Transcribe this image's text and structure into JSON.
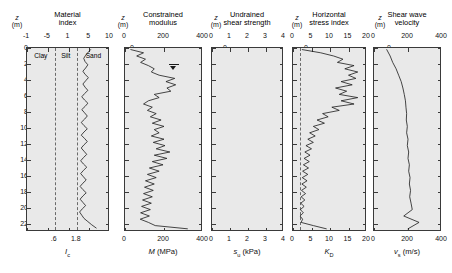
{
  "figure": {
    "depth_axis": {
      "label_symbol": "z",
      "label_unit": "(m)",
      "ticks": [
        0,
        2,
        4,
        6,
        8,
        10,
        12,
        14,
        16,
        18,
        20,
        22
      ],
      "min": 0,
      "max": 23,
      "direction": "down"
    },
    "background_color": "#e9e9e9",
    "curve_color": "#1a1a1a",
    "frame_color": "#3a3a3a"
  },
  "panels": [
    {
      "id": "material-index",
      "title_line1": "Material",
      "title_line2": "index",
      "top_ticks": [
        "-1",
        "-5",
        "1",
        "5",
        "10"
      ],
      "bottom_ticks": [
        ".6",
        "1.8"
      ],
      "axis_title_symbol": "I",
      "axis_title_sub": "c",
      "axis_title_unit": "",
      "zones": [
        "Clay",
        "Silt",
        "Sand"
      ],
      "xmin": 0,
      "xmax": 3,
      "dividers": [
        1.0,
        1.8
      ]
    },
    {
      "id": "constrained-modulus",
      "title_line1": "Constrained",
      "title_line2": "modulus",
      "ticks": [
        0,
        200,
        400
      ],
      "axis_title_symbol": "M",
      "axis_title_unit": "(MPa)",
      "xmin": 0,
      "xmax": 400,
      "water_table_depth": 2.0
    },
    {
      "id": "undrained-shear-strength",
      "title_line1": "Undrained",
      "title_line2": "shear strength",
      "ticks": [
        0,
        1,
        2,
        3,
        4
      ],
      "axis_title_symbol": "s",
      "axis_title_sub": "u",
      "axis_title_unit": "(kPa)",
      "xmin": 0,
      "xmax": 4
    },
    {
      "id": "horizontal-stress-index",
      "title_line1": "Horizontal",
      "title_line2": "stress index",
      "ticks": [
        0,
        5,
        10,
        15,
        20
      ],
      "axis_title_symbol": "K",
      "axis_title_sub": "D",
      "axis_title_unit": "",
      "xmin": 0,
      "xmax": 20,
      "reference_line": 2
    },
    {
      "id": "shear-wave-velocity",
      "title_line1": "Shear wave",
      "title_line2": "velocity",
      "ticks": [
        0,
        200,
        400
      ],
      "axis_title_symbol": "v",
      "axis_title_sub": "s",
      "axis_title_unit": "(m/s)",
      "xmin": 0,
      "xmax": 400
    }
  ],
  "chart_data": {
    "type": "line",
    "ylabel": "z (m)",
    "ylim": [
      0,
      23
    ],
    "grid": false,
    "legend": "none",
    "orientation": "depth-on-y-inverted",
    "series": [
      {
        "name": "Material index",
        "panel": "material-index",
        "xlabel": "I_c",
        "xlim": [
          0,
          3
        ],
        "top_axis_ticks": [
          -1,
          -5,
          1,
          5,
          10
        ],
        "bottom_axis_ticks": [
          0.6,
          1.8
        ],
        "zone_boundaries": [
          1.0,
          1.8
        ],
        "depth": [
          0.2,
          0.5,
          0.9,
          1.3,
          1.7,
          2.1,
          2.5,
          2.9,
          3.3,
          3.7,
          4.1,
          4.5,
          4.9,
          5.3,
          5.7,
          6.1,
          6.5,
          6.9,
          7.3,
          7.7,
          8.1,
          8.5,
          8.9,
          9.3,
          9.7,
          10.1,
          10.5,
          10.9,
          11.3,
          11.7,
          12.1,
          12.5,
          12.9,
          13.3,
          13.7,
          14.1,
          14.5,
          14.9,
          15.3,
          15.7,
          16.1,
          16.5,
          16.9,
          17.3,
          17.7,
          18.1,
          18.5,
          18.9,
          19.3,
          19.7,
          20.1,
          20.5,
          20.9,
          21.3,
          21.7,
          22.1,
          22.5
        ],
        "values": [
          2.3,
          2.22,
          2.12,
          2.05,
          2.1,
          2.2,
          2.12,
          2.02,
          2.1,
          2.22,
          2.12,
          2.02,
          2.1,
          2.2,
          2.08,
          1.98,
          2.08,
          2.2,
          2.1,
          1.98,
          2.08,
          2.18,
          2.08,
          1.96,
          2.06,
          2.18,
          2.06,
          1.96,
          2.08,
          2.18,
          2.06,
          1.96,
          2.06,
          2.16,
          2.04,
          1.94,
          2.04,
          2.16,
          2.04,
          1.94,
          2.04,
          2.14,
          2.02,
          1.92,
          2.02,
          2.14,
          2.02,
          1.92,
          2.02,
          2.12,
          2.0,
          1.9,
          1.98,
          2.06,
          2.2,
          2.34,
          2.5
        ]
      },
      {
        "name": "Constrained modulus",
        "panel": "constrained-modulus",
        "xlabel": "M (MPa)",
        "xlim": [
          0,
          400
        ],
        "depth": [
          0.2,
          0.6,
          1.0,
          1.4,
          1.8,
          2.2,
          2.6,
          3.0,
          3.4,
          3.8,
          4.2,
          4.6,
          5.0,
          5.4,
          5.8,
          6.2,
          6.6,
          7.0,
          7.4,
          7.8,
          8.2,
          8.6,
          9.0,
          9.4,
          9.8,
          10.2,
          10.6,
          11.0,
          11.4,
          11.8,
          12.2,
          12.6,
          13.0,
          13.4,
          13.8,
          14.2,
          14.6,
          15.0,
          15.4,
          15.8,
          16.2,
          16.6,
          17.0,
          17.4,
          17.8,
          18.2,
          18.6,
          19.0,
          19.4,
          19.8,
          20.2,
          20.6,
          21.0,
          21.4,
          21.8,
          22.2,
          22.6
        ],
        "values": [
          30,
          95,
          60,
          105,
          80,
          120,
          150,
          135,
          175,
          255,
          210,
          260,
          215,
          235,
          150,
          175,
          120,
          95,
          140,
          115,
          160,
          130,
          185,
          140,
          200,
          150,
          175,
          135,
          200,
          145,
          205,
          160,
          230,
          150,
          215,
          140,
          195,
          125,
          175,
          115,
          160,
          105,
          150,
          100,
          145,
          95,
          140,
          90,
          135,
          85,
          130,
          80,
          125,
          78,
          120,
          155,
          320
        ]
      },
      {
        "name": "Undrained shear strength",
        "panel": "undrained-shear-strength",
        "xlabel": "s_u (kPa)",
        "xlim": [
          0,
          4
        ],
        "depth": [],
        "values": [],
        "note": "panel empty - no data plotted"
      },
      {
        "name": "Horizontal stress index",
        "panel": "horizontal-stress-index",
        "xlabel": "K_D",
        "xlim": [
          0,
          20
        ],
        "reference_line": 2,
        "depth": [
          0.2,
          0.6,
          1.0,
          1.4,
          1.8,
          2.2,
          2.6,
          3.0,
          3.4,
          3.8,
          4.2,
          4.6,
          5.0,
          5.4,
          5.8,
          6.2,
          6.6,
          7.0,
          7.4,
          7.8,
          8.2,
          8.6,
          9.0,
          9.4,
          9.8,
          10.2,
          10.6,
          11.0,
          11.4,
          11.8,
          12.2,
          12.6,
          13.0,
          13.4,
          13.8,
          14.2,
          14.6,
          15.0,
          15.4,
          15.8,
          16.2,
          16.6,
          17.0,
          17.4,
          17.8,
          18.2,
          18.6,
          19.0,
          19.4,
          19.8,
          20.2,
          20.6,
          21.0,
          21.4,
          21.8,
          22.2,
          22.6
        ],
        "values": [
          2.5,
          7.5,
          11.0,
          13.5,
          12.0,
          16.5,
          14.0,
          17.5,
          15.0,
          17.0,
          13.0,
          16.0,
          11.5,
          14.5,
          12.5,
          17.5,
          13.0,
          16.5,
          10.5,
          12.5,
          8.0,
          9.5,
          6.5,
          8.5,
          5.5,
          7.0,
          4.5,
          6.0,
          4.0,
          5.5,
          3.5,
          5.0,
          3.2,
          4.6,
          3.0,
          4.4,
          2.8,
          4.2,
          2.6,
          4.0,
          2.5,
          3.8,
          2.4,
          3.6,
          2.3,
          3.4,
          2.2,
          3.2,
          2.1,
          3.0,
          2.0,
          2.8,
          1.9,
          2.6,
          2.2,
          5.5,
          9.0
        ]
      },
      {
        "name": "Shear wave velocity",
        "panel": "shear-wave-velocity",
        "xlabel": "v_s (m/s)",
        "xlim": [
          0,
          400
        ],
        "depth": [
          0.2,
          1.0,
          1.8,
          2.6,
          3.4,
          4.2,
          5.0,
          5.8,
          6.6,
          7.4,
          8.2,
          9.0,
          9.8,
          10.6,
          11.4,
          12.2,
          13.0,
          13.8,
          14.6,
          15.4,
          16.2,
          17.0,
          17.8,
          18.6,
          19.4,
          20.2,
          21.0,
          21.8,
          22.6
        ],
        "values": [
          75,
          95,
          110,
          130,
          145,
          160,
          170,
          178,
          185,
          188,
          192,
          190,
          196,
          192,
          200,
          196,
          204,
          200,
          208,
          204,
          212,
          208,
          215,
          210,
          218,
          225,
          175,
          265,
          200
        ]
      }
    ]
  }
}
